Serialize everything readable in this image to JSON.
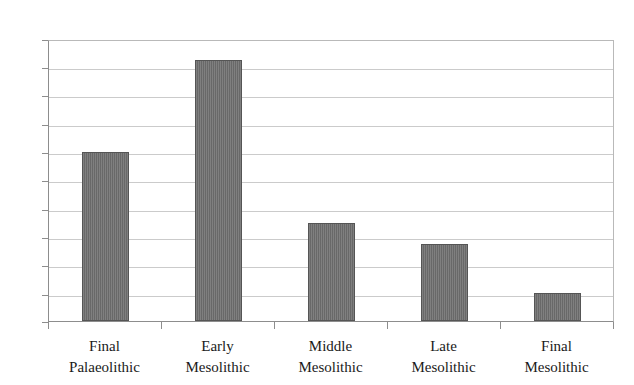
{
  "chart_data": {
    "type": "bar",
    "title": "",
    "subtitle": "",
    "xlabel": "",
    "ylabel": "",
    "categories": [
      "Final Palaeolithic",
      "Early Mesolithic",
      "Middle Mesolithic",
      "Late Mesolithic",
      "Final Mesolithic"
    ],
    "category_lines": [
      [
        "Final",
        "Palaeolithic"
      ],
      [
        "Early",
        "Mesolithic"
      ],
      [
        "Middle",
        "Mesolithic"
      ],
      [
        "Late",
        "Mesolithic"
      ],
      [
        "Final",
        "Mesolithic"
      ]
    ],
    "values": [
      12.0,
      18.6,
      7.0,
      5.5,
      2.0
    ],
    "ylim": [
      0,
      20
    ],
    "ytick_step": 2,
    "yticks": [
      20,
      18,
      16,
      14,
      12,
      10,
      8,
      6,
      4,
      2,
      0
    ],
    "grid": true,
    "legend": false,
    "legend_position": "none",
    "series": [
      {
        "name": "",
        "values": [
          12.0,
          18.6,
          7.0,
          5.5,
          2.0
        ]
      }
    ]
  },
  "style": {
    "bar_color": "#6e6e6e",
    "bar_border_color": "#555555",
    "grid_color": "#cbcbcb",
    "axis_color": "#8d8d8d",
    "background": "#ffffff",
    "text_color": "#1a1a1a"
  }
}
